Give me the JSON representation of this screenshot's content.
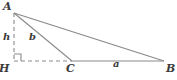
{
  "figure": {
    "type": "geometry-diagram",
    "background_color": "#ffffff",
    "stroke_color": "#808080",
    "label_color": "#3c3c3c",
    "vertices": {
      "A": {
        "label": "A",
        "x": 14,
        "y": 13
      },
      "B": {
        "label": "B",
        "x": 164,
        "y": 61
      },
      "C": {
        "label": "C",
        "x": 72,
        "y": 61
      },
      "H": {
        "label": "H",
        "x": 14,
        "y": 61
      }
    },
    "sides": {
      "a": {
        "label": "a",
        "from": "C",
        "to": "B",
        "style": "solid"
      },
      "b": {
        "label": "b",
        "from": "A",
        "to": "C",
        "style": "solid"
      },
      "hypotenuse": {
        "label": "",
        "from": "A",
        "to": "B",
        "style": "solid"
      }
    },
    "altitude": {
      "label": "h",
      "from": "A",
      "to": "H",
      "style": "dashed"
    },
    "base_extension": {
      "label": "",
      "from": "H",
      "to": "C",
      "style": "dashed"
    },
    "right_angle_marker": {
      "name": "right-angle-square",
      "at": "H",
      "size": 7
    }
  }
}
